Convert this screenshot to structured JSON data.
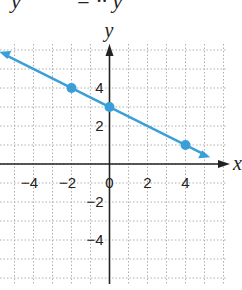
{
  "top_fragment": "  y          = ·· y",
  "chart_data": {
    "type": "line",
    "title": "",
    "xlabel": "x",
    "ylabel": "y",
    "xlim": [
      -5.8,
      6.1
    ],
    "ylim": [
      -6.3,
      6.3
    ],
    "grid": true,
    "x_tick_labels": [
      "-4",
      "-2",
      "0",
      "2",
      "4"
    ],
    "y_tick_labels": [
      "4",
      "2",
      "-2",
      "-4"
    ],
    "series": [
      {
        "name": "line",
        "color": "#3a9fd8",
        "slope": -0.5,
        "intercept": 3,
        "points": [
          [
            -2,
            4
          ],
          [
            0,
            3
          ],
          [
            4,
            1
          ]
        ]
      }
    ]
  },
  "colors": {
    "line": "#3a9fd8",
    "axis": "#222222",
    "grid": "#b0b0b0"
  }
}
